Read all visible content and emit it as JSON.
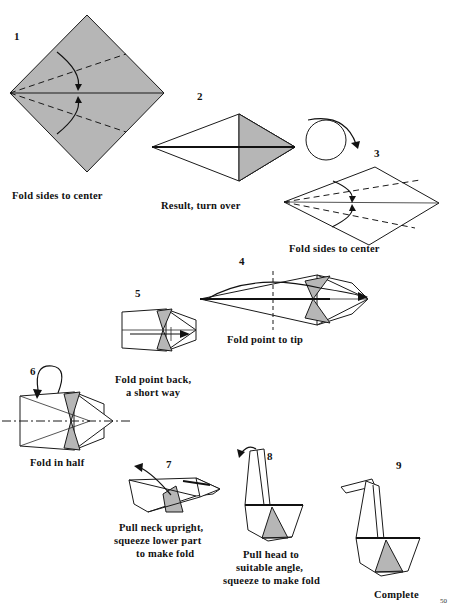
{
  "page": {
    "page_number": "50",
    "background_color": "#ffffff",
    "ink_color": "#111111",
    "paper_gray": "#b6b6b6"
  },
  "steps": [
    {
      "id": 1,
      "number": "1",
      "number_pos": {
        "x": 14,
        "y": 40
      },
      "caption": "Fold sides to center",
      "caption_pos": {
        "x": 12,
        "y": 199
      },
      "shape": "diamond-gray"
    },
    {
      "id": 2,
      "number": "2",
      "number_pos": {
        "x": 197,
        "y": 100
      },
      "caption": "Result, turn over",
      "caption_pos": {
        "x": 161,
        "y": 209
      },
      "shape": "kite-gray-tip"
    },
    {
      "id": 3,
      "number": "3",
      "number_pos": {
        "x": 374,
        "y": 157
      },
      "caption": "Fold sides to center",
      "caption_pos": {
        "x": 289,
        "y": 252
      },
      "shape": "kite-white-dashed"
    },
    {
      "id": 4,
      "number": "4",
      "number_pos": {
        "x": 239,
        "y": 265
      },
      "caption": "Fold point to tip",
      "caption_pos": {
        "x": 227,
        "y": 343
      },
      "shape": "long-dart-vertical-crease"
    },
    {
      "id": 5,
      "number": "5",
      "number_pos": {
        "x": 135,
        "y": 297
      },
      "caption": "Fold point back,\na short way",
      "caption_lines": [
        "Fold point back,",
        "a short way"
      ],
      "caption_pos": {
        "x": 115,
        "y": 383
      },
      "shape": "dart-short"
    },
    {
      "id": 6,
      "number": "6",
      "number_pos": {
        "x": 30,
        "y": 375
      },
      "caption": "Fold in half",
      "caption_pos": {
        "x": 30,
        "y": 466
      },
      "shape": "dart-fold-in-half"
    },
    {
      "id": 7,
      "number": "7",
      "number_pos": {
        "x": 166,
        "y": 468
      },
      "caption": "Pull neck upright,\nsqueeze lower part\nto make fold",
      "caption_lines": [
        "Pull neck upright,",
        "squeeze lower part",
        "to make fold"
      ],
      "caption_pos": {
        "x": 119,
        "y": 531
      },
      "shape": "flat-body"
    },
    {
      "id": 8,
      "number": "8",
      "number_pos": {
        "x": 267,
        "y": 460
      },
      "caption": "Pull head to\nsuitable angle,\nsqueeze to make fold",
      "caption_lines": [
        "Pull head to",
        "suitable angle,",
        "squeeze to make fold"
      ],
      "caption_pos": {
        "x": 243,
        "y": 558
      },
      "shape": "swan-neck-up"
    },
    {
      "id": 9,
      "number": "9",
      "number_pos": {
        "x": 396,
        "y": 469
      },
      "caption": "Complete",
      "caption_pos": {
        "x": 374,
        "y": 598
      },
      "shape": "swan-complete"
    }
  ],
  "annotations": {
    "turn_over_symbol": "circular-rotate-arrow",
    "fold_arrow_symbol": "curved-fold-arrow",
    "valley_fold_line": "dashed",
    "half_fold_axis": "dash-dot"
  }
}
